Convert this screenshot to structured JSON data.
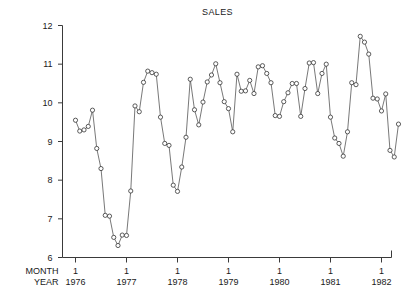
{
  "chart_data": {
    "type": "line",
    "title": "SALES",
    "xlabel": "",
    "ylabel": "",
    "ylim": [
      6,
      12
    ],
    "yticks": [
      6,
      7,
      8,
      9,
      10,
      11,
      12
    ],
    "grid": false,
    "legend": null,
    "marker": "open-circle",
    "axis_corner_labels": [
      "MONTH",
      "YEAR"
    ],
    "x_month_ticks": [
      "1",
      "1",
      "1",
      "1",
      "1",
      "1",
      "1"
    ],
    "x_year_ticks": [
      "1976",
      "1977",
      "1978",
      "1979",
      "1980",
      "1981",
      "1982"
    ],
    "x_tick_positions": [
      1976.0,
      1977.0,
      1978.0,
      1979.0,
      1980.0,
      1981.0,
      1982.0
    ],
    "x_start": 1976.0,
    "x_end": 1982.0,
    "x_step_years": 0.08333,
    "n_points": 73,
    "values": [
      9.55,
      9.27,
      9.3,
      9.39,
      9.81,
      8.82,
      8.3,
      7.09,
      7.07,
      6.52,
      6.31,
      6.58,
      6.57,
      7.72,
      9.92,
      9.77,
      10.53,
      10.82,
      10.78,
      10.74,
      9.63,
      8.95,
      8.9,
      7.87,
      7.71,
      8.34,
      9.11,
      10.61,
      9.82,
      9.43,
      10.02,
      10.54,
      10.72,
      11.01,
      10.52,
      10.03,
      9.85,
      9.25,
      10.74,
      10.3,
      10.31,
      10.58,
      10.24,
      10.93,
      10.96,
      10.76,
      10.52,
      9.67,
      9.65,
      10.03,
      10.26,
      10.5,
      10.5,
      9.65,
      10.37,
      11.03,
      11.04,
      10.24,
      10.76,
      11.0,
      9.63,
      9.09,
      8.95,
      8.62,
      9.25,
      10.52,
      10.47,
      11.72,
      11.57,
      11.26,
      10.12,
      10.1,
      9.79
    ],
    "y_min_observed": 6.31,
    "y_max_observed": 11.72,
    "tail_values": [
      10.23,
      8.77,
      8.6,
      9.45
    ]
  }
}
